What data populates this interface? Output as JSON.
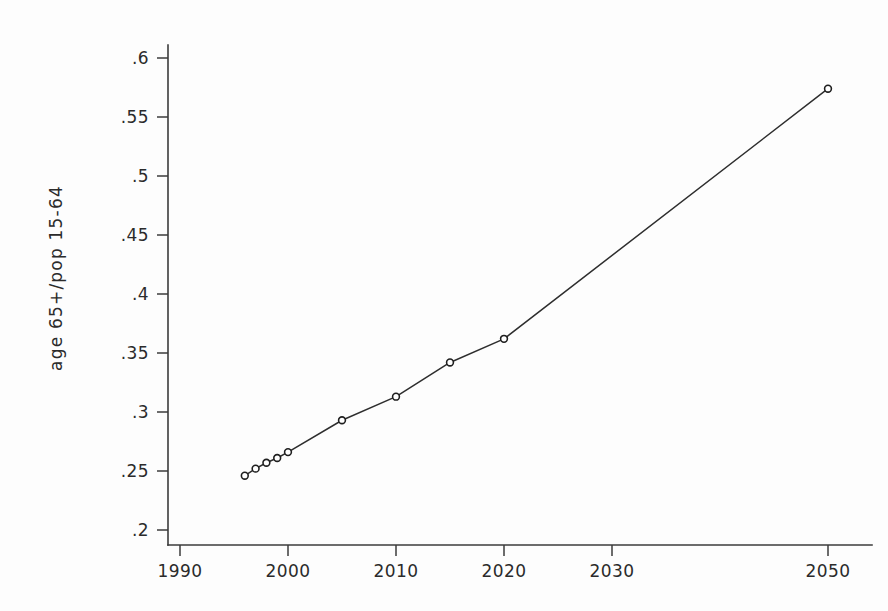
{
  "chart_data": {
    "type": "line",
    "title": "",
    "xlabel": "",
    "ylabel": "age 65+/pop 15-64",
    "x": [
      1996,
      1997,
      1998,
      1999,
      2000,
      2005,
      2010,
      2015,
      2020,
      2050
    ],
    "values": [
      0.246,
      0.252,
      0.257,
      0.261,
      0.266,
      0.293,
      0.313,
      0.342,
      0.362,
      0.574
    ],
    "series": [
      {
        "name": "age 65+/pop 15-64",
        "values": [
          0.246,
          0.252,
          0.257,
          0.261,
          0.266,
          0.293,
          0.313,
          0.342,
          0.362,
          0.574
        ]
      }
    ],
    "xlim": [
      1990,
      2052
    ],
    "ylim": [
      0.19,
      0.615
    ],
    "x_ticks": [
      1990,
      2000,
      2010,
      2020,
      2030,
      2050
    ],
    "x_tick_labels": [
      "1990",
      "2000",
      "2010",
      "2020",
      "2030",
      "2050"
    ],
    "y_ticks": [
      0.2,
      0.25,
      0.3,
      0.35,
      0.4,
      0.45,
      0.5,
      0.55,
      0.6
    ],
    "y_tick_labels": [
      ".2",
      ".25",
      ".3",
      ".35",
      ".4",
      ".45",
      ".5",
      ".55",
      ".6"
    ],
    "grid": false,
    "legend": "none",
    "marker": "open-circle",
    "line_color": "#2e2e2e",
    "marker_fill": "#ffffff",
    "marker_edge": "#1f1f1f",
    "background": "#fdfdfd",
    "annotations": []
  },
  "axis": {
    "y_title": "age 65+/pop 15-64"
  }
}
